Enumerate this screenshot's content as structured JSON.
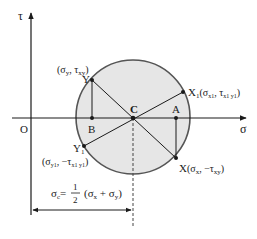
{
  "diagram": {
    "axes": {
      "vertical_label": "τ",
      "horizontal_label": "σ",
      "origin_label": "O"
    },
    "colors": {
      "circle_fill": "#e6e6e6",
      "circle_stroke": "#555555",
      "line": "#1a1a1a"
    },
    "points": {
      "C": {
        "label": "C"
      },
      "A": {
        "label": "A"
      },
      "B": {
        "label": "B"
      },
      "Y": {
        "label": "Y",
        "coords": "(σ",
        "coords_sub1": "y",
        "coords_mid": ", τ",
        "coords_sub2": "xy",
        "coords_end": ")"
      },
      "X": {
        "label": "X",
        "coords": "(σ",
        "coords_sub1": "x",
        "coords_mid": ", −τ",
        "coords_sub2": "xy",
        "coords_end": ")"
      },
      "X1": {
        "label": "X",
        "label_sub": "1",
        "coords": "(σ",
        "coords_sub1": "x1",
        "coords_mid": ", τ",
        "coords_sub2": "x1 y1",
        "coords_end": ")"
      },
      "Y1": {
        "label": "Y",
        "label_sub": "1",
        "coords": "(σ",
        "coords_sub1": "y1",
        "coords_mid": ", −τ",
        "coords_sub2": "x1 y1",
        "coords_end": ")"
      }
    },
    "formula": {
      "lhs": "σ",
      "lhs_sub": "c",
      "equals": "=",
      "num": "1",
      "den": "2",
      "rhs_open": "(σ",
      "rhs_sub1": "x",
      "rhs_plus": " + σ",
      "rhs_sub2": "y",
      "rhs_close": ")"
    }
  }
}
